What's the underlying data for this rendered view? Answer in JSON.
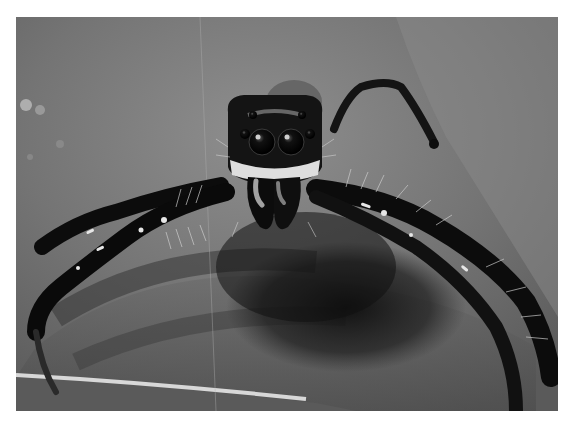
{
  "image": {
    "subject": "jumping spider macro photograph",
    "style": "grayscale",
    "frame_color": "#ffffff",
    "colors": {
      "background_light": "#8c8c8c",
      "background_mid": "#6e6e6e",
      "background_dark": "#3a3a3a",
      "shadow": "#141414",
      "spider_body": "#0c0c0c",
      "highlight": "#e6e6e6"
    }
  },
  "caption": {
    "text": ""
  }
}
